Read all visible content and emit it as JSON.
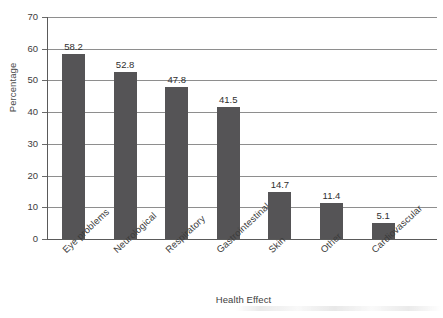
{
  "chart_data": {
    "type": "bar",
    "title": "",
    "xlabel": "Health Effect",
    "ylabel": "Percentage",
    "categories": [
      "Eye problems",
      "Neurological",
      "Respiratory",
      "Gastrointestinal",
      "Skin",
      "Other",
      "Cardiovascular"
    ],
    "values": [
      58.2,
      52.8,
      47.8,
      41.5,
      14.7,
      11.4,
      5.1
    ],
    "value_labels": [
      "58.2",
      "52.8",
      "47.8",
      "41.5",
      "14.7",
      "11.4",
      "5.1"
    ],
    "ylim": [
      0,
      70
    ],
    "ytick_labels": [
      "0",
      "10",
      "20",
      "30",
      "40",
      "50",
      "60",
      "70"
    ],
    "ytick_values": [
      0,
      10,
      20,
      30,
      40,
      50,
      60,
      70
    ],
    "grid": true,
    "grid_axis": "y",
    "legend": false,
    "bar_color": "#555456",
    "gridline_color": "#8e8e8e",
    "axis_color": "#5a5a5a",
    "text_color": "#3c3c3c"
  }
}
